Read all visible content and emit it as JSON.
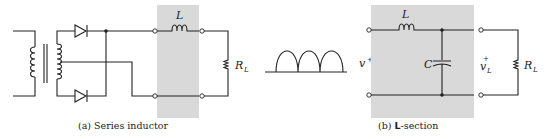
{
  "figure_a": {
    "caption_prefix": "(a)",
    "caption_text": "Series inductor",
    "inductor_label": "L",
    "load_label": "R",
    "load_sub": "L"
  },
  "figure_b": {
    "caption_prefix": "(b)",
    "caption_bold": "L",
    "caption_rest": "-section",
    "inductor_label": "L",
    "capacitor_label": "C",
    "input_label": "v",
    "input_sup": "+",
    "output_label": "v",
    "output_sub": "L",
    "output_sup": "+",
    "load_label": "R",
    "load_sub": "L"
  },
  "colors": {
    "shade": "#d9d9d9",
    "line": "#222222"
  }
}
